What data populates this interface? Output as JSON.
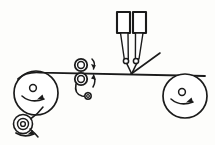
{
  "diagram": {
    "title": "Web coating line schematic",
    "background_color": "#fdfdfb",
    "line_color": "#1b1b1b",
    "canvas": {
      "width": 215,
      "height": 145
    },
    "parts": {
      "unwind_roll": {
        "name": "unwind-roll",
        "label": "Large left roller",
        "cx": 36,
        "cy": 93,
        "r": 22,
        "hub_cx": 33,
        "hub_cy": 88,
        "hub_r": 3.4,
        "rotation": "clockwise"
      },
      "feed_roll": {
        "name": "feed-roll",
        "label": "Small lower-left roll",
        "cx": 23,
        "cy": 124,
        "r_outer": 9.5,
        "r_mid": 5.5,
        "r_inner": 2.4,
        "rotation": "clockwise"
      },
      "upper_nip_roller": {
        "name": "upper-nip-roller",
        "label": "Upper pinch roller",
        "cx": 81,
        "cy": 65,
        "r_outer": 6.2,
        "r_inner": 3.4,
        "rotation": "clockwise"
      },
      "lower_nip_roller": {
        "name": "lower-nip-roller",
        "label": "Lower pinch roller",
        "cx": 81,
        "cy": 79,
        "r_outer": 6.2,
        "r_inner": 3.4,
        "rotation": "counter-clockwise"
      },
      "pivot_pin": {
        "name": "pivot-pin",
        "label": "Arm pivot pin",
        "cx": 88,
        "cy": 96,
        "r_outer": 3.2,
        "r_inner": 1.4
      },
      "applicator_head_left": {
        "name": "applicator-head-left",
        "label": "Left applicator reservoir",
        "x": 117,
        "y": 12,
        "width": 13,
        "height": 21
      },
      "applicator_head_right": {
        "name": "applicator-head-right",
        "label": "Right applicator reservoir",
        "x": 133,
        "y": 12,
        "width": 13,
        "height": 21
      },
      "nozzle_left": {
        "name": "nozzle-left",
        "label": "Left nozzle tip",
        "cx": 126,
        "cy": 61,
        "r": 2.6
      },
      "nozzle_right": {
        "name": "nozzle-right",
        "label": "Right nozzle tip",
        "cx": 136,
        "cy": 61,
        "r": 2.6
      },
      "rewind_roll": {
        "name": "rewind-roll",
        "label": "Large right roller",
        "cx": 185,
        "cy": 96,
        "r": 22,
        "hub_cx": 182,
        "hub_cy": 92,
        "hub_r": 3.4,
        "rotation": "clockwise"
      },
      "web": {
        "name": "web-line",
        "label": "Web / substrate path",
        "start_x": 18,
        "start_y": 73,
        "end_x": 205,
        "end_y": 76
      },
      "blade": {
        "name": "doctor-blade",
        "label": "Angled blade",
        "x1": 131,
        "y1": 74,
        "x2": 160,
        "y2": 53
      }
    },
    "arrows": [
      {
        "name": "arrow-unwind-rotation",
        "direction": "clockwise"
      },
      {
        "name": "arrow-feed-roll-rotation",
        "direction": "clockwise"
      },
      {
        "name": "arrow-upper-nip-rotation",
        "direction": "clockwise"
      },
      {
        "name": "arrow-lower-nip-rotation",
        "direction": "counter-clockwise"
      },
      {
        "name": "arrow-rewind-rotation",
        "direction": "clockwise"
      }
    ]
  }
}
